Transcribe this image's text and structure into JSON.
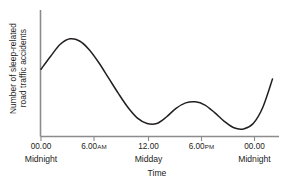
{
  "chart_data": {
    "type": "line",
    "title": "",
    "xlabel": "Time",
    "ylabel_line1": "Number of sleep-related",
    "ylabel_line2": "road traffic accidents",
    "xticks": [
      "00.00",
      "6.00AM",
      "12.00",
      "6.00PM",
      "00.00"
    ],
    "xtick_sublabels": [
      "Midnight",
      "",
      "Midday",
      "",
      "Midnight"
    ],
    "yticks": [],
    "grid": false,
    "legend": "none",
    "xlim": [
      0,
      24
    ],
    "ylim": [
      0,
      100
    ],
    "x": [
      0,
      1,
      2,
      3,
      4,
      5,
      6,
      7,
      8,
      9,
      10,
      11,
      12,
      13,
      14,
      15,
      16,
      17,
      18,
      19,
      20,
      21,
      22,
      23,
      24
    ],
    "values": [
      62,
      74,
      85,
      90,
      88,
      80,
      68,
      54,
      40,
      27,
      17,
      12,
      12,
      18,
      26,
      31,
      32,
      29,
      22,
      14,
      8,
      7,
      12,
      27,
      53
    ],
    "series": [
      {
        "name": "Sleep-related road traffic accidents",
        "values": [
          62,
          74,
          85,
          90,
          88,
          80,
          68,
          54,
          40,
          27,
          17,
          12,
          12,
          18,
          26,
          31,
          32,
          29,
          22,
          14,
          8,
          7,
          12,
          27,
          53
        ]
      }
    ],
    "annotations": [
      {
        "label": "primary peak",
        "x": 3
      },
      {
        "label": "morning trough",
        "x": 11.3
      },
      {
        "label": "afternoon secondary peak",
        "x": 15.8
      },
      {
        "label": "evening trough",
        "x": 20.8
      }
    ],
    "line_color": "#231f20",
    "axis_color": "#8c8c8c"
  },
  "xaxis": {
    "ticks": [
      {
        "label_main": "00.00",
        "label_sc": "",
        "sub": "Midnight"
      },
      {
        "label_main": "6.00",
        "label_sc": "AM",
        "sub": ""
      },
      {
        "label_main": "12.00",
        "label_sc": "",
        "sub": "Midday"
      },
      {
        "label_main": "6.00",
        "label_sc": "PM",
        "sub": ""
      },
      {
        "label_main": "00.00",
        "label_sc": "",
        "sub": "Midnight"
      }
    ],
    "title": "Time"
  },
  "yaxis": {
    "title_line1": "Number of sleep-related",
    "title_line2": "road traffic accidents"
  }
}
